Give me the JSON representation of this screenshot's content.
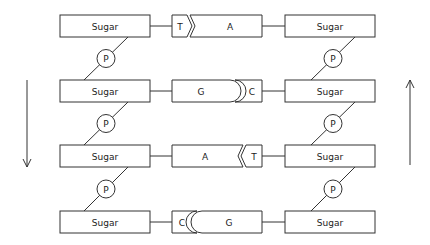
{
  "colors": {
    "stroke": "#333333",
    "background": "#ffffff",
    "text": "#222222"
  },
  "strands": {
    "left": {
      "direction": "down",
      "sugar_label": "Sugar",
      "phosphate_label": "P"
    },
    "right": {
      "direction": "up",
      "sugar_label": "Sugar",
      "phosphate_label": "P"
    }
  },
  "rows": [
    {
      "left_sugar": "Sugar",
      "left_base": "T",
      "right_base": "A",
      "right_sugar": "Sugar",
      "pair_shape": "chevron",
      "small_side": "left"
    },
    {
      "left_sugar": "Sugar",
      "left_base": "G",
      "right_base": "C",
      "right_sugar": "Sugar",
      "pair_shape": "round",
      "small_side": "right"
    },
    {
      "left_sugar": "Sugar",
      "left_base": "A",
      "right_base": "T",
      "right_sugar": "Sugar",
      "pair_shape": "chevron",
      "small_side": "right"
    },
    {
      "left_sugar": "Sugar",
      "left_base": "C",
      "right_base": "G",
      "right_sugar": "Sugar",
      "pair_shape": "round",
      "small_side": "left"
    }
  ],
  "phosphates": {
    "left": [
      "P",
      "P",
      "P"
    ],
    "right": [
      "P",
      "P",
      "P"
    ]
  },
  "arrows": {
    "left": {
      "direction": "down"
    },
    "right": {
      "direction": "up"
    }
  }
}
